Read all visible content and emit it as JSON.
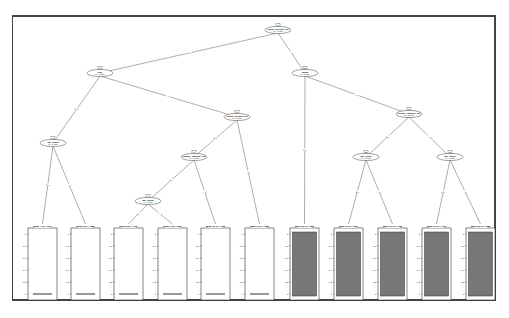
{
  "colors": {
    "frame": "#444444",
    "edge": "#777777",
    "bar_dark": "#777777",
    "bar_light": "#ffffff",
    "median_line": "#333333"
  },
  "tree": {
    "inner_nodes": [
      {
        "id": 1,
        "label": "1",
        "var": "region_selected_cat",
        "p": "p < 0.001",
        "x": 278,
        "y": 30
      },
      {
        "id": 2,
        "label": "2",
        "var": "type",
        "p": "p < 0.001",
        "x": 100,
        "y": 73
      },
      {
        "id": 3,
        "label": "3",
        "var": "age_group",
        "p": "p < 0.001",
        "x": 53,
        "y": 143
      },
      {
        "id": 5,
        "label": "5",
        "var": "region_selected_cat",
        "p": "p < 0.001",
        "x": 237,
        "y": 117
      },
      {
        "id": 6,
        "label": "6",
        "var": "income_category_cat",
        "p": "p < 0.001",
        "x": 194,
        "y": 157
      },
      {
        "id": 7,
        "label": "7",
        "var": "age_group",
        "p": "p < 0.001",
        "x": 148,
        "y": 201
      },
      {
        "id": 12,
        "label": "12",
        "var": "group",
        "p": "p < 0.001",
        "x": 305,
        "y": 73
      },
      {
        "id": 14,
        "label": "14",
        "var": "income_category_cat",
        "p": "p < 0.001",
        "x": 409,
        "y": 114
      },
      {
        "id": 15,
        "label": "15",
        "var": "age_group",
        "p": "p < 0.001",
        "x": 366,
        "y": 157
      },
      {
        "id": 18,
        "label": "18",
        "var": "age_group",
        "p": "p < 0.001",
        "x": 450,
        "y": 157
      }
    ],
    "edges": [
      {
        "from": 1,
        "to": 2,
        "label": "≤ 0"
      },
      {
        "from": 1,
        "to": 12,
        "label": "> 0"
      },
      {
        "from": 2,
        "to": 3,
        "label": "≤ 0"
      },
      {
        "from": 2,
        "to": 5,
        "label": "> 0"
      },
      {
        "from": 3,
        "to": "L4",
        "label": "≤ 0"
      },
      {
        "from": 3,
        "to": "L5",
        "label": "> 0"
      },
      {
        "from": 5,
        "to": 6,
        "label": "≤ 0"
      },
      {
        "from": 5,
        "to": "L11",
        "label": "> 0"
      },
      {
        "from": 6,
        "to": 7,
        "label": "≤ 0"
      },
      {
        "from": 6,
        "to": "L10",
        "label": "> 0"
      },
      {
        "from": 7,
        "to": "L8",
        "label": "≤ 0"
      },
      {
        "from": 7,
        "to": "L9",
        "label": "> 0"
      },
      {
        "from": 12,
        "to": "L13",
        "label": "≤ 0"
      },
      {
        "from": 12,
        "to": 14,
        "label": "> 0"
      },
      {
        "from": 14,
        "to": 15,
        "label": "≤ 0"
      },
      {
        "from": 14,
        "to": 18,
        "label": "> 0"
      },
      {
        "from": 15,
        "to": "L16",
        "label": "≤ 0"
      },
      {
        "from": 15,
        "to": "L17",
        "label": "> 0"
      },
      {
        "from": 18,
        "to": "L19",
        "label": "≤ 0"
      },
      {
        "from": 18,
        "to": "L20",
        "label": "> 0"
      }
    ],
    "leaves": [
      {
        "id": "L4",
        "title": "Node 4 (n = 107)",
        "value": 0,
        "x": 19
      },
      {
        "id": "L5",
        "title": "Node 5 (n = 168)",
        "value": 0,
        "x": 62
      },
      {
        "id": "L8",
        "title": "Node 8 (n = 175)",
        "value": 0,
        "x": 105
      },
      {
        "id": "L9",
        "title": "Node 9 (n = 136)",
        "value": 0,
        "x": 149
      },
      {
        "id": "L10",
        "title": "Node 10 (n = 195)",
        "value": 0,
        "x": 192
      },
      {
        "id": "L11",
        "title": "Node 11 (n = 153)",
        "value": 0,
        "x": 236
      },
      {
        "id": "L13",
        "title": "Node 13 (n = 186)",
        "value": 1,
        "x": 281
      },
      {
        "id": "L16",
        "title": "Node 16 (n = 224)",
        "value": 1,
        "x": 325
      },
      {
        "id": "L17",
        "title": "Node 17 (n = 135)",
        "value": 1,
        "x": 369
      },
      {
        "id": "L19",
        "title": "Node 19 (n = 171)",
        "value": 1,
        "x": 413
      },
      {
        "id": "L20",
        "title": "Node 20 (n = 158)",
        "value": 1,
        "x": 457
      }
    ],
    "yaxis_ticks": [
      "1",
      "0.8",
      "0.6",
      "0.4",
      "0.2",
      "0"
    ]
  }
}
